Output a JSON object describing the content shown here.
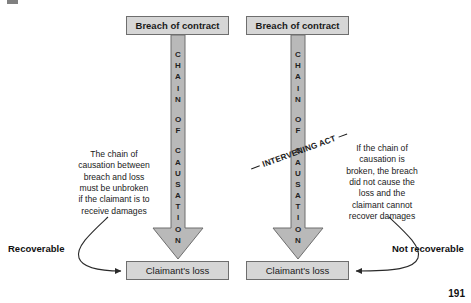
{
  "page": {
    "page_number": "191",
    "background_color": "#ffffff"
  },
  "colors": {
    "box_fill": "#d6d6d6",
    "box_border": "#6e6e6e",
    "arrow_fill": "#b9b9b9",
    "arrow_border": "#6e6e6e",
    "text": "#1a1a1a"
  },
  "diagram": {
    "left_panel": {
      "top_box_label": "Breach of contract",
      "bottom_box_label": "Claimant's loss",
      "arrow_letters": [
        "C",
        "H",
        "A",
        "I",
        "N",
        "",
        "O",
        "F",
        "",
        "C",
        "A",
        "U",
        "S",
        "A",
        "T",
        "I",
        "O",
        "N"
      ],
      "arrow_text": "CHAIN OF CAUSATION",
      "explanation": "The chain of\ncausation between\nbreach and loss\nmust be unbroken\nif the claimant is to\nreceive damages",
      "outcome_label": "Recoverable"
    },
    "right_panel": {
      "top_box_label": "Breach of contract",
      "bottom_box_label": "Claimant's loss",
      "arrow_letters": [
        "C",
        "H",
        "A",
        "I",
        "N",
        "",
        "O",
        "F",
        "",
        "C",
        "A",
        "U",
        "S",
        "A",
        "T",
        "I",
        "O",
        "N"
      ],
      "arrow_text": "CHAIN OF CAUSATION",
      "intervening_label": "INTERVENING ACT",
      "explanation": "If the  chain of\ncausation is\nbroken, the breach\ndid not cause the\nloss and the\nclaimant cannot\nrecover damages",
      "outcome_label": "Not recoverable"
    }
  }
}
